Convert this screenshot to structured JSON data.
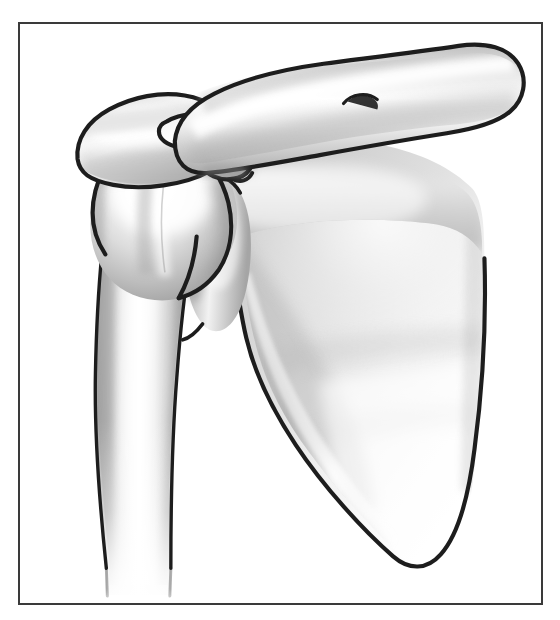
{
  "figure": {
    "style": "medical line illustration with grayscale airbrush shading",
    "background_color": "#ffffff",
    "frame": {
      "present": true,
      "color": "#3a3a3a",
      "thickness_px": 2,
      "x": 18,
      "y": 22,
      "width": 525,
      "height": 583
    },
    "outline_color": "#1d1d1d",
    "labels_present": false,
    "caption": ""
  },
  "palette": {
    "bone_light": "#ffffff",
    "bone_mid": "#d8d8d8",
    "bone_shadow": "#a8a8a8",
    "bone_deep_shadow": "#8a8a8a",
    "scapula_body_fill": "#c9c9c9",
    "outline": "#1d1d1d",
    "frame": "#3a3a3a",
    "background": "#ffffff"
  },
  "structures": [
    {
      "id": "clavicle",
      "name": "Clavicle",
      "common_name": "collarbone",
      "position": "upper right, horizontal S-curved bone",
      "notes": "runs from acromial end at left to rounded sternal end at far right edge"
    },
    {
      "id": "acromion",
      "name": "Acromion",
      "common_name": "acromion process of scapula",
      "position": "upper left, hood over humeral head",
      "notes": "forms the roof of the subacromial space"
    },
    {
      "id": "coracoid",
      "name": "Coracoid process",
      "common_name": "coracoid",
      "position": "center upper, hook-shaped projection",
      "notes": "small beak-like hook projecting anteriorly beneath the clavicle"
    },
    {
      "id": "scapula",
      "name": "Scapula",
      "common_name": "shoulder blade",
      "position": "right two-thirds, large triangular plate",
      "notes": "broad triangular body tapering to inferior angle at lower right"
    },
    {
      "id": "glenoid",
      "name": "Glenoid fossa",
      "common_name": "glenoid cavity",
      "position": "center, articulation with humeral head",
      "notes": "shallow socket receiving the humeral head"
    },
    {
      "id": "humerus-head",
      "name": "Head of humerus",
      "common_name": "humeral head",
      "position": "left center, rounded ball",
      "notes": "spherical articular head with greater tubercle lateral"
    },
    {
      "id": "greater-tubercle",
      "name": "Greater tubercle",
      "common_name": "greater tuberosity",
      "position": "left of humeral head",
      "notes": "lateral prominence of proximal humerus"
    },
    {
      "id": "humerus-shaft",
      "name": "Shaft of humerus",
      "common_name": "upper arm bone shaft",
      "position": "lower left, vertical column fading downward",
      "notes": "descends vertically and fades to white at the bottom of the frame"
    }
  ]
}
